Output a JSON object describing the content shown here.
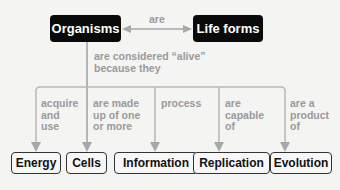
{
  "diagram": {
    "top": {
      "left_node": "Organisms",
      "right_node": "Life forms",
      "link_label": "are"
    },
    "branch_label_line1": "are considered “alive”",
    "branch_label_line2": "because they",
    "branches": [
      {
        "label_lines": [
          "acquire",
          "and",
          "use"
        ],
        "node": "Energy"
      },
      {
        "label_lines": [
          "are made",
          "up of one",
          "or more"
        ],
        "node": "Cells"
      },
      {
        "label_lines": [
          "process"
        ],
        "node": "Information"
      },
      {
        "label_lines": [
          "are",
          "capable",
          "of"
        ],
        "node": "Replication"
      },
      {
        "label_lines": [
          "are a",
          "product",
          "of"
        ],
        "node": "Evolution"
      }
    ]
  },
  "colors": {
    "top_node_bg": "#0a0a0a",
    "line": "#a8a8a8",
    "label_text": "#9a9a9a",
    "bottom_node_border": "#333333"
  }
}
